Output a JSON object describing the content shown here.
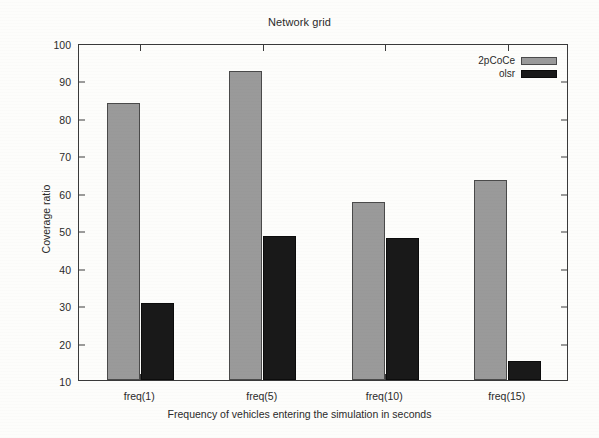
{
  "chart_data": {
    "type": "bar",
    "title": "Network grid",
    "xlabel": "Frequency of vehicles entering the simulation in seconds",
    "ylabel": "Coverage ratio",
    "categories": [
      "freq(1)",
      "freq(5)",
      "freq(10)",
      "freq(15)"
    ],
    "series": [
      {
        "name": "2pCoCe",
        "color": "#9a9a9a",
        "values": [
          84,
          92.5,
          57.5,
          63.5
        ]
      },
      {
        "name": "olsr",
        "color": "#191919",
        "values": [
          30.5,
          48.5,
          48,
          15
        ]
      }
    ],
    "ylim": [
      10,
      100
    ],
    "yticks": [
      10,
      20,
      30,
      40,
      50,
      60,
      70,
      80,
      90,
      100
    ],
    "ytick_labels": [
      "10",
      "20",
      "30",
      "40",
      "50",
      "60",
      "70",
      "80",
      "90",
      "100"
    ],
    "grid": false,
    "legend_position": "top-right"
  },
  "legend": {
    "entries": [
      {
        "label": "2pCoCe",
        "swatch": "legend-swatch-gray"
      },
      {
        "label": "olsr",
        "swatch": "legend-swatch-black"
      }
    ]
  }
}
